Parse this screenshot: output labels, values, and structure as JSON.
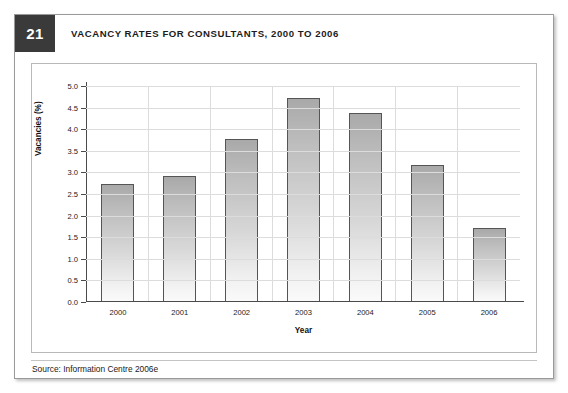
{
  "figure": {
    "number": "21",
    "title": "VACANCY RATES FOR CONSULTANTS, 2000 TO 2006",
    "source": "Source: Information Centre 2006e"
  },
  "chart_data": {
    "type": "bar",
    "title": "VACANCY RATES FOR CONSULTANTS, 2000 TO 2006",
    "categories": [
      "2000",
      "2001",
      "2002",
      "2003",
      "2004",
      "2005",
      "2006"
    ],
    "values": [
      2.7,
      2.9,
      3.75,
      4.7,
      4.35,
      3.15,
      1.7
    ],
    "series": [
      {
        "name": "Vacancies (%)",
        "values": [
          2.7,
          2.9,
          3.75,
          4.7,
          4.35,
          3.15,
          1.7
        ]
      }
    ],
    "xlabel": "Year",
    "ylabel": "Vacancies (%)",
    "ylim": [
      0.0,
      5.0
    ],
    "ytick_step": 0.5,
    "yticks": [
      "0.0",
      "0.5",
      "1.0",
      "1.5",
      "2.0",
      "2.5",
      "3.0",
      "3.5",
      "4.0",
      "4.5",
      "5.0"
    ],
    "grid": true,
    "legend": "none",
    "bar_color": "#c9c9c9",
    "bar_edge_color": "#555555"
  }
}
